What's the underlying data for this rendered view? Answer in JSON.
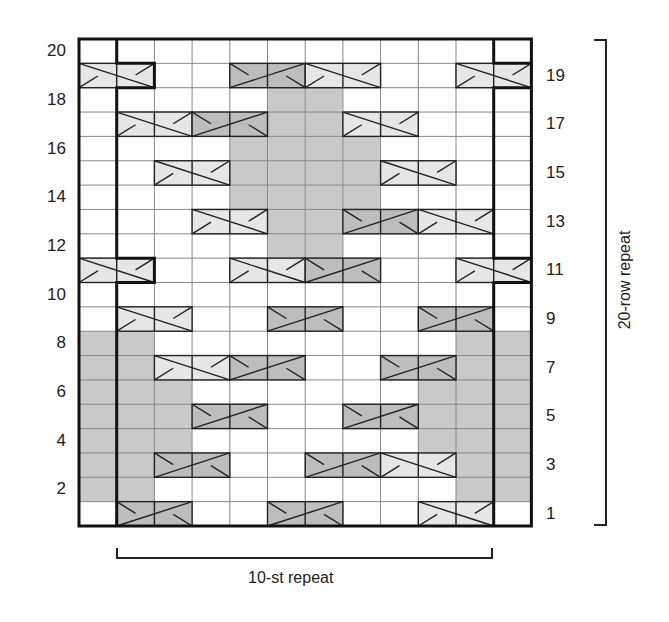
{
  "chart": {
    "columns": 12,
    "rows": 20,
    "grid": {
      "left": 79,
      "top": 39,
      "cell_w": 37.7,
      "cell_h": 24.35
    },
    "colors": {
      "white": "#ffffff",
      "gray_shade": "#c9c9c9",
      "cable_light": "#e6e6e6",
      "cable_dark": "#bdbdbd",
      "grid_line": "#888888",
      "thick_line": "#111111"
    },
    "left_row_labels": [
      "2",
      "4",
      "6",
      "8",
      "10",
      "12",
      "14",
      "16",
      "18",
      "20"
    ],
    "right_row_labels": [
      "1",
      "3",
      "5",
      "7",
      "9",
      "11",
      "13",
      "15",
      "17",
      "19"
    ],
    "shaded_cells": [
      {
        "cols": [
          0,
          1,
          10,
          11
        ],
        "rows": [
          2,
          3,
          4,
          5,
          6,
          7,
          8
        ]
      },
      {
        "cols": [
          2,
          9
        ],
        "rows": [
          4,
          5,
          6
        ]
      },
      {
        "cols": [
          5,
          6
        ],
        "rows": [
          12,
          13,
          14,
          15,
          16,
          17,
          18
        ]
      },
      {
        "cols": [
          4,
          7
        ],
        "rows": [
          14,
          15,
          16
        ]
      }
    ],
    "cables": [
      {
        "row": 1,
        "col": 1,
        "type": "left-cross",
        "tone": "dark"
      },
      {
        "row": 1,
        "col": 5,
        "type": "left-cross",
        "tone": "dark"
      },
      {
        "row": 1,
        "col": 9,
        "type": "right-cross",
        "tone": "light"
      },
      {
        "row": 3,
        "col": 2,
        "type": "left-cross",
        "tone": "dark"
      },
      {
        "row": 3,
        "col": 6,
        "type": "left-cross",
        "tone": "dark"
      },
      {
        "row": 3,
        "col": 8,
        "type": "right-cross",
        "tone": "light"
      },
      {
        "row": 5,
        "col": 3,
        "type": "left-cross",
        "tone": "dark"
      },
      {
        "row": 5,
        "col": 7,
        "type": "left-cross",
        "tone": "dark"
      },
      {
        "row": 7,
        "col": 2,
        "type": "right-cross",
        "tone": "light"
      },
      {
        "row": 7,
        "col": 4,
        "type": "left-cross",
        "tone": "dark"
      },
      {
        "row": 7,
        "col": 8,
        "type": "left-cross",
        "tone": "dark"
      },
      {
        "row": 9,
        "col": 1,
        "type": "right-cross",
        "tone": "light"
      },
      {
        "row": 9,
        "col": 5,
        "type": "left-cross",
        "tone": "dark"
      },
      {
        "row": 9,
        "col": 9,
        "type": "left-cross",
        "tone": "dark"
      },
      {
        "row": 11,
        "col": 0,
        "type": "right-cross",
        "tone": "light"
      },
      {
        "row": 11,
        "col": 4,
        "type": "right-cross",
        "tone": "light"
      },
      {
        "row": 11,
        "col": 6,
        "type": "left-cross",
        "tone": "dark"
      },
      {
        "row": 11,
        "col": 10,
        "type": "right-cross",
        "tone": "light"
      },
      {
        "row": 13,
        "col": 3,
        "type": "right-cross",
        "tone": "light"
      },
      {
        "row": 13,
        "col": 7,
        "type": "left-cross",
        "tone": "dark"
      },
      {
        "row": 13,
        "col": 9,
        "type": "right-cross",
        "tone": "light"
      },
      {
        "row": 15,
        "col": 2,
        "type": "right-cross",
        "tone": "light"
      },
      {
        "row": 15,
        "col": 8,
        "type": "right-cross",
        "tone": "light"
      },
      {
        "row": 17,
        "col": 1,
        "type": "right-cross",
        "tone": "light"
      },
      {
        "row": 17,
        "col": 3,
        "type": "left-cross",
        "tone": "dark"
      },
      {
        "row": 17,
        "col": 7,
        "type": "right-cross",
        "tone": "light"
      },
      {
        "row": 19,
        "col": 0,
        "type": "right-cross",
        "tone": "light"
      },
      {
        "row": 19,
        "col": 4,
        "type": "left-cross",
        "tone": "dark"
      },
      {
        "row": 19,
        "col": 6,
        "type": "right-cross",
        "tone": "light"
      },
      {
        "row": 19,
        "col": 10,
        "type": "right-cross",
        "tone": "light"
      }
    ],
    "stitch_repeat_label": "10-st repeat",
    "row_repeat_label": "20-row repeat"
  }
}
